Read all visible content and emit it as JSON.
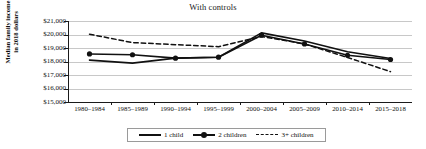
{
  "chart_data": {
    "type": "line",
    "title": "With controls",
    "xlabel": "",
    "ylabel": "Median family income\nin 2018 dollars",
    "ylabel_line1": "Median family income",
    "ylabel_line2": "in 2018 dollars",
    "categories": [
      "1980–1984",
      "1985–1989",
      "1990–1994",
      "1995–1999",
      "2000–2004",
      "2005–2009",
      "2010–2014",
      "2015–2018"
    ],
    "ylim": [
      15000,
      21000
    ],
    "ytick_values": [
      21000,
      20000,
      19000,
      18000,
      17000,
      16000,
      15000
    ],
    "ytick_labels": [
      "$21,000",
      "$20,000",
      "$19,000",
      "$18,000",
      "$17,000",
      "$16,000",
      "$15,000"
    ],
    "grid": true,
    "legend_position": "bottom-center",
    "series": [
      {
        "name": "1 child",
        "style": "solid",
        "markers": false,
        "color": "#111111",
        "values": [
          18100,
          17880,
          18250,
          18320,
          20120,
          19520,
          18720,
          18220
        ]
      },
      {
        "name": "2 children",
        "style": "solid",
        "markers": true,
        "color": "#111111",
        "values": [
          18560,
          18500,
          18250,
          18320,
          19950,
          19300,
          18460,
          18150
        ]
      },
      {
        "name": "3+ children",
        "style": "dashed",
        "markers": false,
        "color": "#111111",
        "values": [
          20020,
          19400,
          19250,
          19100,
          19850,
          19300,
          18300,
          17250
        ]
      }
    ]
  },
  "legend": {
    "items": [
      {
        "label": "1 child"
      },
      {
        "label": "2 children"
      },
      {
        "label": "3+ children"
      }
    ]
  }
}
